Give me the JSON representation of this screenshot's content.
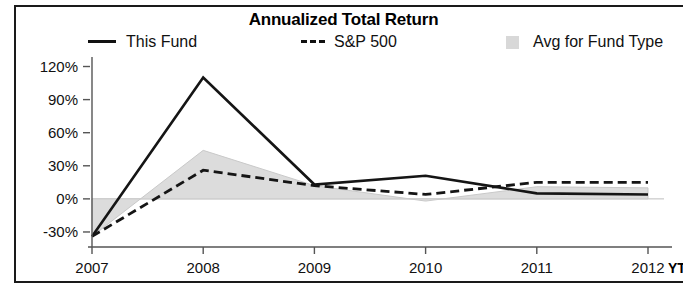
{
  "chart_data": {
    "type": "line",
    "title": "Annualized Total Return",
    "xlabel": "",
    "ylabel": "",
    "categories": [
      "2007",
      "2008",
      "2009",
      "2010",
      "2011",
      "2012"
    ],
    "x_extra_label": "YTD",
    "ylim": [
      -40,
      125
    ],
    "yticks": [
      -30,
      0,
      30,
      60,
      90,
      120
    ],
    "ytick_labels": [
      "-30%",
      "0%",
      "30%",
      "60%",
      "90%",
      "120%"
    ],
    "grid": false,
    "legend_position": "top",
    "series": [
      {
        "name": "This Fund",
        "style": "solid",
        "color": "#151515",
        "values": [
          -34,
          110,
          13,
          21,
          5,
          4
        ]
      },
      {
        "name": "S&P 500",
        "style": "dashed",
        "color": "#151515",
        "values": [
          -34,
          26,
          12,
          4,
          15,
          15
        ]
      },
      {
        "name": "Avg for Fund Type",
        "style": "area",
        "color": "#dcdcdc",
        "values": [
          -34,
          44,
          12,
          -2,
          11,
          10
        ]
      }
    ],
    "annotations": []
  },
  "legend": {
    "items": [
      {
        "label": "This Fund",
        "marker": "solid-line-swatch"
      },
      {
        "label": "S&P 500",
        "marker": "dashed-line-swatch"
      },
      {
        "label": "Avg for Fund Type",
        "marker": "area-fill-swatch"
      }
    ]
  }
}
